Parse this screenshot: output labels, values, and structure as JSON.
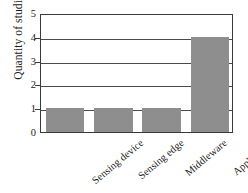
{
  "chart_data": {
    "type": "bar",
    "title": "",
    "xlabel": "",
    "ylabel": "Quantity of studies",
    "categories": [
      "Sensing device",
      "Sensing edge",
      "Middleware",
      "Application"
    ],
    "values": [
      1,
      1,
      1,
      4
    ],
    "ylim": [
      0,
      5
    ],
    "yticks": [
      0,
      1,
      2,
      3,
      4,
      5
    ],
    "ytick_labels": [
      "0",
      "1",
      "2",
      "3",
      "4",
      "5"
    ],
    "grid": true,
    "grid_axis": "y",
    "legend": false,
    "legend_position": "none",
    "bar_color": "#8e8e8e",
    "axis_color": "#3a3a3a",
    "background_color": "#ffffff",
    "text_color": "#1c1c1c",
    "xtick_label_rotation": -40
  }
}
